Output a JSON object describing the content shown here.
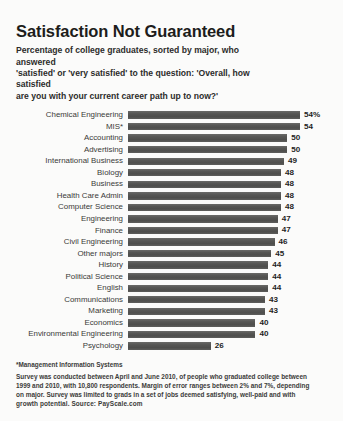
{
  "title": "Satisfaction Not Guaranteed",
  "subtitle_lines": [
    "Percentage of college graduates, sorted by major, who answered",
    "'satisfied' or 'very satisfied' to the question: 'Overall, how satisfied",
    "are you with your current career path up to now?'"
  ],
  "footnote": "*Management Information Systems",
  "survey_lines": [
    "Survey was conducted between April and June 2010, of people who graduated college between",
    "1999 and 2010, with 10,800 respondents. Margin of error ranges between 2% and 7%, depending",
    "on major. Survey was limited to grads in a set of jobs deemed satisfying, well-paid and with",
    "growth potential.     Source: PayScale.com"
  ],
  "colors": {
    "bar": "#565654",
    "text": "#2b2b2b",
    "background": "#fbfbfa"
  },
  "chart_data": {
    "type": "bar",
    "orientation": "horizontal",
    "title": "Satisfaction Not Guaranteed",
    "subtitle": "Percentage of college graduates, sorted by major, who answered 'satisfied' or 'very satisfied' to the question: 'Overall, how satisfied are you with your current career path up to now?'",
    "xlabel": "",
    "ylabel": "",
    "xlim": [
      0,
      54
    ],
    "grid": false,
    "legend": false,
    "value_unit": "%",
    "categories": [
      "Chemical Engineering",
      "MIS*",
      "Accounting",
      "Advertising",
      "International Business",
      "Biology",
      "Business",
      "Health Care Admin",
      "Computer Science",
      "Engineering",
      "Finance",
      "Civil Engineering",
      "Other majors",
      "History",
      "Political Science",
      "English",
      "Communications",
      "Marketing",
      "Economics",
      "Environmental Engineering",
      "Psychology"
    ],
    "values": [
      54,
      54,
      50,
      50,
      49,
      48,
      48,
      48,
      48,
      47,
      47,
      46,
      45,
      44,
      44,
      44,
      43,
      43,
      40,
      40,
      26
    ],
    "value_labels": [
      "54%",
      "54",
      "50",
      "50",
      "49",
      "48",
      "48",
      "48",
      "48",
      "47",
      "47",
      "46",
      "45",
      "44",
      "44",
      "44",
      "43",
      "43",
      "40",
      "40",
      "26"
    ],
    "source": "PayScale.com"
  }
}
